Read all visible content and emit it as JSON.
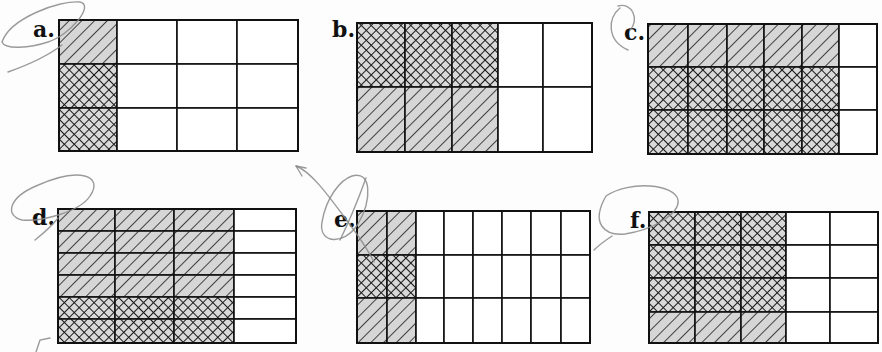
{
  "figure": {
    "colors": {
      "background": "#fdfdfd",
      "grid_line": "#111111",
      "hatch_fill": "#d6d6d6",
      "crosshatch_fill": "#d9d9d9",
      "pattern_line": "#1a1a1a",
      "pencil": "#8a8a8a"
    },
    "legend": {
      "h": "diagonal hatch (light gray with / lines)",
      "x": "crosshatch (diamond mesh)",
      "0": "unshaded"
    },
    "grids": [
      {
        "label": "a.",
        "rows": 3,
        "cols": 4,
        "xs": [
          59,
          117,
          177,
          237,
          298
        ],
        "ys": [
          20,
          64,
          108,
          151
        ],
        "cells": [
          [
            "h",
            "0",
            "0",
            "0"
          ],
          [
            "x",
            "0",
            "0",
            "0"
          ],
          [
            "x",
            "0",
            "0",
            "0"
          ]
        ],
        "label_pos": [
          33,
          37
        ]
      },
      {
        "label": "b.",
        "rows": 2,
        "cols": 5,
        "xs": [
          357,
          405,
          452,
          498,
          543,
          592
        ],
        "ys": [
          23,
          87,
          152
        ],
        "cells": [
          [
            "x",
            "x",
            "x",
            "0",
            "0"
          ],
          [
            "h",
            "h",
            "h",
            "0",
            "0"
          ]
        ],
        "label_pos": [
          332,
          37
        ]
      },
      {
        "label": "c.",
        "rows": 3,
        "cols": 6,
        "xs": [
          648,
          688,
          727,
          764,
          802,
          839,
          877
        ],
        "ys": [
          24,
          67,
          110,
          154
        ],
        "cells": [
          [
            "h",
            "h",
            "h",
            "h",
            "h",
            "0"
          ],
          [
            "x",
            "x",
            "x",
            "x",
            "x",
            "0"
          ],
          [
            "x",
            "x",
            "x",
            "x",
            "x",
            "0"
          ]
        ],
        "label_pos": [
          624,
          40
        ]
      },
      {
        "label": "d.",
        "rows": 6,
        "cols": 4,
        "xs": [
          58,
          115,
          174,
          234,
          296
        ],
        "ys": [
          209,
          231,
          253,
          275,
          297,
          319,
          343
        ],
        "cells": [
          [
            "h",
            "h",
            "h",
            "0"
          ],
          [
            "h",
            "h",
            "h",
            "0"
          ],
          [
            "h",
            "h",
            "h",
            "0"
          ],
          [
            "h",
            "h",
            "h",
            "0"
          ],
          [
            "x",
            "x",
            "x",
            "0"
          ],
          [
            "x",
            "x",
            "x",
            "0"
          ]
        ],
        "label_pos": [
          32,
          225
        ]
      },
      {
        "label": "e.",
        "rows": 3,
        "cols": 8,
        "xs": [
          357,
          387,
          416,
          444,
          473,
          502,
          531,
          561,
          590
        ],
        "ys": [
          211,
          255,
          298,
          343
        ],
        "cells": [
          [
            "h",
            "h",
            "0",
            "0",
            "0",
            "0",
            "0",
            "0"
          ],
          [
            "x",
            "x",
            "0",
            "0",
            "0",
            "0",
            "0",
            "0"
          ],
          [
            "h",
            "h",
            "0",
            "0",
            "0",
            "0",
            "0",
            "0"
          ]
        ],
        "label_pos": [
          334,
          227
        ]
      },
      {
        "label": "f.",
        "rows": 4,
        "cols": 5,
        "xs": [
          649,
          695,
          741,
          786,
          830,
          878
        ],
        "ys": [
          212,
          245,
          278,
          312,
          343
        ],
        "cells": [
          [
            "x",
            "x",
            "x",
            "0",
            "0"
          ],
          [
            "x",
            "x",
            "x",
            "0",
            "0"
          ],
          [
            "x",
            "x",
            "x",
            "0",
            "0"
          ],
          [
            "h",
            "h",
            "h",
            "0",
            "0"
          ]
        ],
        "label_pos": [
          630,
          228
        ]
      }
    ],
    "pencil_marks": [
      "M 2 42 C 10 18, 60 0, 80 2 C 95 5, 70 35, 48 42 C 30 48, 5 50, 2 42 Z",
      "M 62 45 C 45 58, 25 66, 8 72",
      "M 618 6 C 632 2, 640 20, 630 30",
      "M 620 8 C 608 18, 606 40, 628 50",
      "M 36 186 C 80 166, 104 176, 90 196 C 80 212, 40 222, 22 220 C 5 216, 8 198, 36 186 Z",
      "M 58 218 C 52 226, 45 232, 35 240",
      "M 36 352 L 40 340 L 50 338",
      "M 296 166 C 312 172, 330 198, 348 222 C 360 238, 368 250, 374 262",
      "M 296 166 L 302 176 M 296 166 L 306 168",
      "M 352 176 C 372 170, 372 200, 358 224 C 344 246, 318 244, 322 222 C 326 198, 340 180, 352 176",
      "M 366 178 C 358 200, 350 220, 340 240",
      "M 606 196 C 630 180, 675 184, 678 200 C 680 214, 652 230, 625 234 C 605 236, 590 224, 606 196 Z",
      "M 612 236 C 606 240, 600 244, 594 250"
    ]
  }
}
